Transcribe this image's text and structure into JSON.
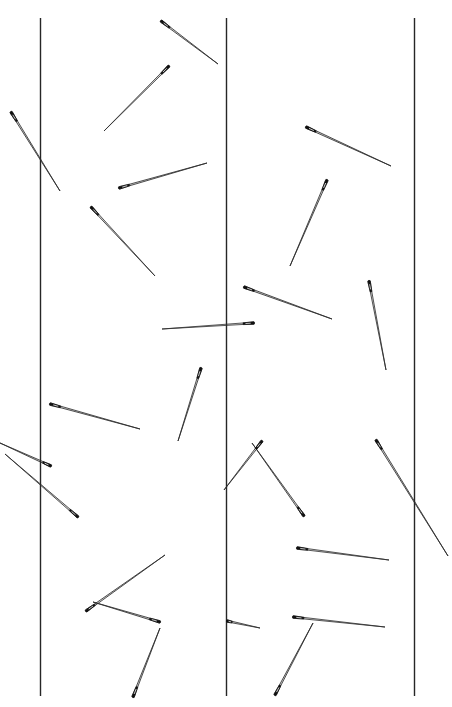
{
  "figure": {
    "name": "buffon-needle-experiment",
    "width": 452,
    "height": 707,
    "background_color": "#ffffff",
    "ink_color": "#1a1a1a"
  },
  "chart_data": {
    "type": "scatter",
    "title": "",
    "subtitle": "",
    "xlabel": "",
    "ylabel": "",
    "xlim": [
      0,
      452
    ],
    "ylim": [
      0,
      707
    ],
    "grid": false,
    "legend": null,
    "annotations": [],
    "tick_labels": {
      "x": [],
      "y": []
    },
    "lines": {
      "name": "parallel-rules",
      "orientation": "vertical",
      "color": "#262626",
      "stroke_width": 1.4,
      "y_start": 18,
      "y_end": 696,
      "x_positions": [
        40.5,
        226.5,
        414.5
      ],
      "spacing": 187
    },
    "needles": {
      "count": 24,
      "body_color": "#2b2b2b",
      "eye_color": "#101010",
      "crossing_count": 8,
      "items": [
        {
          "id": 1,
          "eye_x": 161,
          "eye_y": 21,
          "tip_x": 218,
          "tip_y": 64,
          "length": 71,
          "angle_deg": 37,
          "crosses_line": false
        },
        {
          "id": 2,
          "eye_x": 169,
          "eye_y": 66,
          "tip_x": 104,
          "tip_y": 131,
          "length": 92,
          "angle_deg": 225,
          "crosses_line": false
        },
        {
          "id": 3,
          "eye_x": 11,
          "eye_y": 112,
          "tip_x": 60,
          "tip_y": 191,
          "length": 93,
          "angle_deg": 58,
          "crosses_line": true
        },
        {
          "id": 4,
          "eye_x": 306,
          "eye_y": 127,
          "tip_x": 391,
          "tip_y": 166,
          "length": 94,
          "angle_deg": 25,
          "crosses_line": false
        },
        {
          "id": 5,
          "eye_x": 119,
          "eye_y": 188,
          "tip_x": 207,
          "tip_y": 163,
          "length": 91,
          "angle_deg": 344,
          "crosses_line": false
        },
        {
          "id": 6,
          "eye_x": 91,
          "eye_y": 207,
          "tip_x": 155,
          "tip_y": 276,
          "length": 94,
          "angle_deg": 47,
          "crosses_line": false
        },
        {
          "id": 7,
          "eye_x": 327,
          "eye_y": 180,
          "tip_x": 290,
          "tip_y": 266,
          "length": 94,
          "angle_deg": 113,
          "crosses_line": false
        },
        {
          "id": 8,
          "eye_x": 244,
          "eye_y": 287,
          "tip_x": 332,
          "tip_y": 319,
          "length": 94,
          "angle_deg": 20,
          "crosses_line": true
        },
        {
          "id": 9,
          "eye_x": 254,
          "eye_y": 323,
          "tip_x": 162,
          "tip_y": 329,
          "length": 92,
          "angle_deg": 184,
          "crosses_line": true
        },
        {
          "id": 10,
          "eye_x": 369,
          "eye_y": 281,
          "tip_x": 386,
          "tip_y": 370,
          "length": 91,
          "angle_deg": 79,
          "crosses_line": false
        },
        {
          "id": 11,
          "eye_x": 201,
          "eye_y": 368,
          "tip_x": 178,
          "tip_y": 441,
          "length": 77,
          "angle_deg": 107,
          "crosses_line": false
        },
        {
          "id": 12,
          "eye_x": 50,
          "eye_y": 404,
          "tip_x": 140,
          "tip_y": 429,
          "length": 93,
          "angle_deg": 16,
          "crosses_line": true
        },
        {
          "id": 13,
          "eye_x": 78,
          "eye_y": 517,
          "tip_x": 5,
          "tip_y": 454,
          "length": 96,
          "angle_deg": 221,
          "crosses_line": true
        },
        {
          "id": 14,
          "eye_x": 304,
          "eye_y": 516,
          "tip_x": 252,
          "tip_y": 443,
          "length": 89,
          "angle_deg": 235,
          "crosses_line": false
        },
        {
          "id": 15,
          "eye_x": 376,
          "eye_y": 440,
          "tip_x": 448,
          "tip_y": 556,
          "length": 137,
          "angle_deg": 58,
          "crosses_line": true
        },
        {
          "id": 16,
          "eye_x": 297,
          "eye_y": 548,
          "tip_x": 389,
          "tip_y": 560,
          "length": 93,
          "angle_deg": 7,
          "crosses_line": false
        },
        {
          "id": 17,
          "eye_x": 227,
          "eye_y": 621,
          "tip_x": 260,
          "tip_y": 628,
          "length": 34,
          "angle_deg": 12,
          "crosses_line": false
        },
        {
          "id": 18,
          "eye_x": 86,
          "eye_y": 611,
          "tip_x": 165,
          "tip_y": 555,
          "length": 97,
          "angle_deg": 325,
          "crosses_line": false
        },
        {
          "id": 19,
          "eye_x": 160,
          "eye_y": 622,
          "tip_x": 93,
          "tip_y": 602,
          "length": 70,
          "angle_deg": 197,
          "crosses_line": false
        },
        {
          "id": 20,
          "eye_x": 293,
          "eye_y": 617,
          "tip_x": 385,
          "tip_y": 627,
          "length": 93,
          "angle_deg": 6,
          "crosses_line": false
        },
        {
          "id": 21,
          "eye_x": 275,
          "eye_y": 695,
          "tip_x": 313,
          "tip_y": 623,
          "length": 81,
          "angle_deg": 298,
          "crosses_line": false
        },
        {
          "id": 22,
          "eye_x": 133,
          "eye_y": 697,
          "tip_x": 160,
          "tip_y": 628,
          "length": 74,
          "angle_deg": 291,
          "crosses_line": false
        },
        {
          "id": 23,
          "eye_x": 51,
          "eye_y": 466,
          "tip_x": 0,
          "tip_y": 443,
          "length": 56,
          "angle_deg": 204,
          "crosses_line": false
        },
        {
          "id": 24,
          "eye_x": 262,
          "eye_y": 441,
          "tip_x": 224,
          "tip_y": 490,
          "length": 62,
          "angle_deg": 128,
          "crosses_line": false
        }
      ]
    }
  }
}
